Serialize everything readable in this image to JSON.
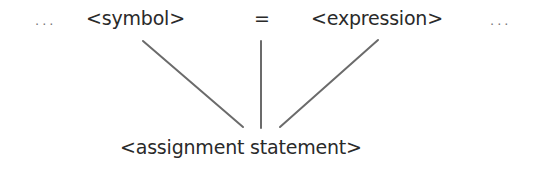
{
  "diagram": {
    "top_row": {
      "leading_ellipsis": "...",
      "symbol": "<symbol>",
      "equals": "=",
      "expression": "<expression>",
      "trailing_ellipsis": "..."
    },
    "bottom_node": "<assignment statement>",
    "edges": [
      {
        "from": "<symbol>",
        "to": "<assignment statement>",
        "x1": 143,
        "y1": 41,
        "x2": 243,
        "y2": 127
      },
      {
        "from": "=",
        "to": "<assignment statement>",
        "x1": 261,
        "y1": 41,
        "x2": 261,
        "y2": 128
      },
      {
        "from": "<expression>",
        "to": "<assignment statement>",
        "x1": 378,
        "y1": 40,
        "x2": 280,
        "y2": 127
      }
    ],
    "line_color": "#6b6b6b"
  }
}
